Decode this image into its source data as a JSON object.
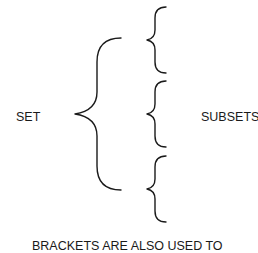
{
  "diagram": {
    "set_label": "SET",
    "subsets_label": "SUBSETS",
    "caption": "BRACKETS ARE ALSO USED TO",
    "stroke_color": "#1a1a1a",
    "large_brace": {
      "top_y": 38,
      "tip_y": 114,
      "bottom_y": 190,
      "tip_x": 75,
      "stem_x": 97,
      "end_x": 121
    },
    "small_braces": [
      {
        "name": "subset-1",
        "top_y": 7,
        "tip_y": 40,
        "bottom_y": 73
      },
      {
        "name": "subset-2",
        "top_y": 81,
        "tip_y": 114,
        "bottom_y": 147
      },
      {
        "name": "subset-3",
        "top_y": 156,
        "tip_y": 189,
        "bottom_y": 222
      }
    ]
  }
}
